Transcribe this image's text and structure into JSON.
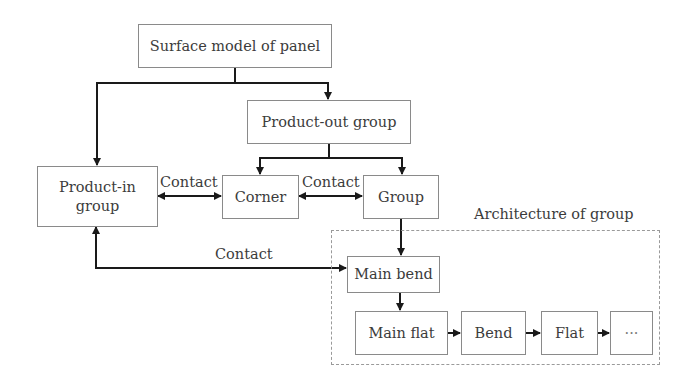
{
  "diagram": {
    "nodes": {
      "surface_model": "Surface model of panel",
      "product_out": "Product-out group",
      "product_in": "Product-in group",
      "corner": "Corner",
      "group": "Group",
      "main_bend": "Main bend",
      "main_flat": "Main flat",
      "bend": "Bend",
      "flat": "Flat",
      "ellipsis": "···"
    },
    "container": {
      "title": "Architecture of group"
    },
    "edge_labels": {
      "contact_productin_corner": "Contact",
      "contact_corner_group": "Contact",
      "contact_productin_mainbend": "Contact"
    },
    "edges": [
      {
        "from": "surface_model",
        "to": "product_in",
        "type": "arrow"
      },
      {
        "from": "surface_model",
        "to": "product_out",
        "type": "arrow"
      },
      {
        "from": "product_out",
        "to": "corner",
        "type": "arrow"
      },
      {
        "from": "product_out",
        "to": "group",
        "type": "arrow"
      },
      {
        "from": "product_in",
        "to": "corner",
        "type": "bidirectional",
        "label": "Contact"
      },
      {
        "from": "corner",
        "to": "group",
        "type": "bidirectional",
        "label": "Contact"
      },
      {
        "from": "product_in",
        "to": "main_bend",
        "type": "bidirectional",
        "label": "Contact"
      },
      {
        "from": "group",
        "to": "main_bend",
        "type": "arrow"
      },
      {
        "from": "main_bend",
        "to": "main_flat",
        "type": "arrow"
      },
      {
        "from": "main_flat",
        "to": "bend",
        "type": "arrow"
      },
      {
        "from": "bend",
        "to": "flat",
        "type": "arrow"
      },
      {
        "from": "flat",
        "to": "ellipsis",
        "type": "arrow"
      }
    ]
  }
}
